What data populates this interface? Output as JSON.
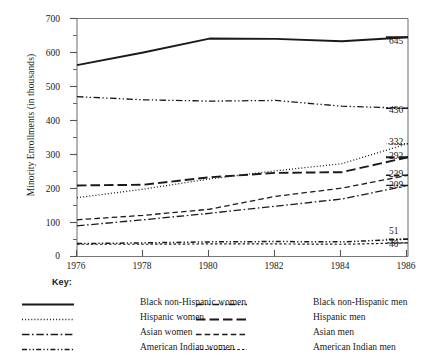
{
  "chart_data": {
    "type": "line",
    "title": "",
    "xlabel": "",
    "ylabel": "Minority Enrollments (in thousands)",
    "x": [
      1976,
      1978,
      1980,
      1982,
      1984,
      1986
    ],
    "xlim": [
      1976,
      1986
    ],
    "ylim": [
      0,
      700
    ],
    "xticks": [
      "1976",
      "1978",
      "1980",
      "1982",
      "1984",
      "1986"
    ],
    "yticks": [
      "0",
      "100",
      "200",
      "300",
      "400",
      "500",
      "600",
      "700"
    ],
    "ytick_step": 100,
    "yminor_step": 50,
    "grid": false,
    "legend_position": "below-plot",
    "legend_title": "Key:",
    "series": [
      {
        "name": "Black non-Hispanic women",
        "dash": "solid",
        "width": 1.9,
        "values": [
          563,
          600,
          641,
          640,
          633,
          645
        ],
        "end_label": "645"
      },
      {
        "name": "Black non-Hispanic men",
        "dash": "dash-dot-dot",
        "width": 1.3,
        "values": [
          470,
          461,
          457,
          459,
          442,
          436
        ],
        "end_label": "436"
      },
      {
        "name": "Hispanic women",
        "dash": "dotted",
        "width": 1.3,
        "values": [
          173,
          198,
          228,
          252,
          273,
          332
        ],
        "end_label": "332"
      },
      {
        "name": "Hispanic men",
        "dash": "long-dash",
        "width": 1.9,
        "values": [
          209,
          211,
          233,
          246,
          248,
          292
        ],
        "end_label": "292"
      },
      {
        "name": "Asian men",
        "dash": "dashed",
        "width": 1.3,
        "values": [
          108,
          121,
          139,
          177,
          201,
          239
        ],
        "end_label": "239"
      },
      {
        "name": "Asian women",
        "dash": "dash-dot",
        "width": 1.3,
        "values": [
          90,
          108,
          127,
          148,
          169,
          209
        ],
        "end_label": "209"
      },
      {
        "name": "American Indian women",
        "dash": "dash-dot-dot-short",
        "width": 1.5,
        "values": [
          38,
          40,
          43,
          44,
          43,
          51
        ],
        "end_label": "51"
      },
      {
        "name": "American Indian men",
        "dash": "fine-dash",
        "width": 1.2,
        "values": [
          36,
          36,
          37,
          37,
          36,
          40
        ],
        "end_label": "40"
      }
    ],
    "end_labels": [
      "645",
      "436",
      "332",
      "292",
      "239",
      "209",
      "51",
      "40"
    ],
    "legend_left_column": [
      "Black non-Hispanic women",
      "Hispanic women",
      "Asian women",
      "American Indian women"
    ],
    "legend_right_column": [
      "Black non-Hispanic men",
      "Hispanic men",
      "Asian men",
      "American Indian men"
    ]
  },
  "colors": {
    "ink": "#1a1a1a",
    "axis": "#6e6e6e",
    "background": "#ffffff"
  }
}
